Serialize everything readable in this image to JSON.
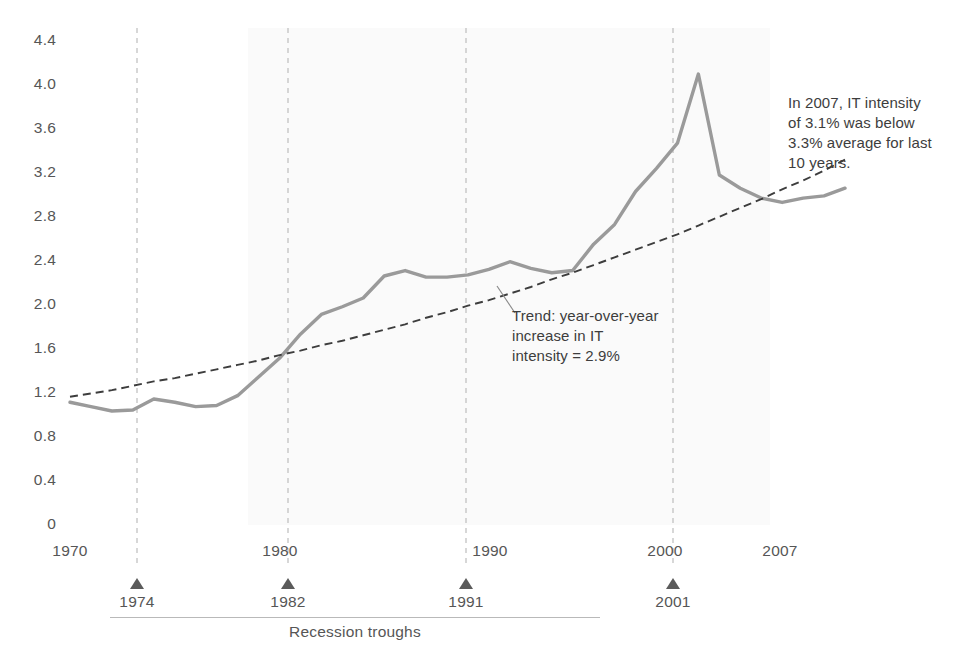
{
  "chart_data": {
    "type": "line",
    "title": "",
    "xlabel": "",
    "ylabel": "",
    "xlim": [
      1970,
      2007
    ],
    "ylim": [
      0,
      4.4
    ],
    "grid": false,
    "legend_position": "none",
    "y_ticks": [
      "4.4",
      "4.0",
      "3.6",
      "3.2",
      "2.8",
      "2.4",
      "2.0",
      "1.6",
      "1.2",
      "0.8",
      "0.4",
      "0"
    ],
    "y_tick_values": [
      4.4,
      4.0,
      3.6,
      3.2,
      2.8,
      2.4,
      2.0,
      1.6,
      1.2,
      0.8,
      0.4,
      0
    ],
    "x_ticks": [
      "1970",
      "1980",
      "1990",
      "2000",
      "2007"
    ],
    "x_tick_values": [
      1970,
      1980,
      1990,
      2000,
      2007
    ],
    "x": [
      1970,
      1971,
      1972,
      1973,
      1974,
      1975,
      1976,
      1977,
      1978,
      1979,
      1980,
      1981,
      1982,
      1983,
      1984,
      1985,
      1986,
      1987,
      1988,
      1989,
      1990,
      1991,
      1992,
      1993,
      1994,
      1995,
      1996,
      1997,
      1998,
      1999,
      2000,
      2001,
      2002,
      2003,
      2004,
      2005,
      2006,
      2007
    ],
    "series": [
      {
        "name": "IT intensity",
        "style": "solid",
        "color": "#9a9a9a",
        "values": [
          1.1,
          1.06,
          1.02,
          1.03,
          1.13,
          1.1,
          1.06,
          1.07,
          1.16,
          1.33,
          1.5,
          1.72,
          1.9,
          1.97,
          2.05,
          2.25,
          2.3,
          2.24,
          2.24,
          2.26,
          2.31,
          2.38,
          2.32,
          2.28,
          2.3,
          2.54,
          2.72,
          3.02,
          3.23,
          3.46,
          4.09,
          3.17,
          3.05,
          2.96,
          2.92,
          2.96,
          2.98,
          3.05
        ]
      },
      {
        "name": "Trend: year-over-year increase in IT intensity",
        "style": "dashed",
        "color": "#3d3d3d",
        "values": [
          1.15,
          1.18,
          1.21,
          1.25,
          1.29,
          1.32,
          1.36,
          1.4,
          1.44,
          1.48,
          1.53,
          1.57,
          1.62,
          1.66,
          1.71,
          1.76,
          1.81,
          1.87,
          1.92,
          1.98,
          2.03,
          2.09,
          2.15,
          2.22,
          2.28,
          2.35,
          2.42,
          2.49,
          2.56,
          2.63,
          2.71,
          2.79,
          2.87,
          2.95,
          3.04,
          3.12,
          3.21,
          3.31
        ]
      }
    ],
    "shaded_band": {
      "from": 1978.5,
      "to": 2003.4,
      "color": "#fafafa"
    },
    "recession_troughs": [
      {
        "year": 1974,
        "label": "1974"
      },
      {
        "year": 1982,
        "label": "1982"
      },
      {
        "year": 1991,
        "label": "1991"
      },
      {
        "year": 2001,
        "label": "2001"
      }
    ],
    "troughs_caption": "Recession troughs",
    "annotations": [
      {
        "name": "trend-annotation",
        "lines": [
          "Trend: year-over-year",
          "increase in IT",
          "intensity = 2.9%"
        ]
      },
      {
        "name": "intensity-annotation",
        "lines": [
          "In 2007, IT intensity",
          "of 3.1% was below",
          "3.3% average for last",
          "10 years."
        ]
      }
    ]
  },
  "labels": {
    "y0": "4.4",
    "y1": "4.0",
    "y2": "3.6",
    "y3": "3.2",
    "y4": "2.8",
    "y5": "2.4",
    "y6": "2.0",
    "y7": "1.6",
    "y8": "1.2",
    "y9": "0.8",
    "y10": "0.4",
    "y11": "0",
    "x0": "1970",
    "x1": "1980",
    "x2": "1990",
    "x3": "2000",
    "x4": "2007",
    "t0": "1974",
    "t1": "1982",
    "t2": "1991",
    "t3": "2001",
    "troughs_caption": "Recession troughs",
    "trend_l1": "Trend: year-over-year",
    "trend_l2": "increase in IT",
    "trend_l3": "intensity = 2.9%",
    "note_l1": "In 2007, IT intensity",
    "note_l2": "of 3.1% was below",
    "note_l3": "3.3% average for last",
    "note_l4": "10 years."
  },
  "colors": {
    "series_line": "#9a9a9a",
    "trend_line": "#3d3d3d",
    "band": "#fafafa",
    "tick_text": "#565656",
    "annotation_text": "#3d3d3d",
    "marker": "#5b5b5b",
    "guide": "#bdbdbd"
  }
}
